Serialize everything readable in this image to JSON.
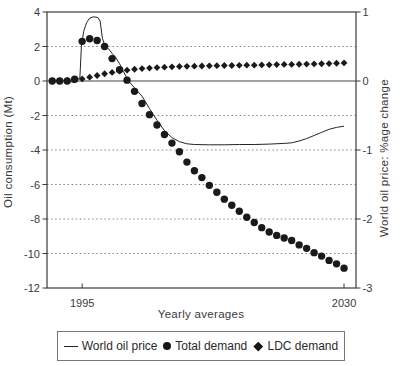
{
  "figure": {
    "background": "#ffffff",
    "ink_color": "#1a1a1a",
    "grid_color": "#777777"
  },
  "chart_data": {
    "type": "line",
    "title": "",
    "xlabel": "Yearly averages",
    "ylabel_left": "Oil consumption (Mt)",
    "ylabel_right": "World oil price: %age change",
    "x_range": [
      1990.3,
      2031.6
    ],
    "ylim_left": [
      -12,
      4
    ],
    "ylim_right": [
      -3,
      1
    ],
    "x_ticks": [
      {
        "year": 1995,
        "label": "1995"
      },
      {
        "year": 2030,
        "label": "2030"
      }
    ],
    "left_ticks": [
      4,
      2,
      0,
      -2,
      -4,
      -6,
      -8,
      -10,
      -12
    ],
    "left_tick_labels": [
      "4",
      "2",
      "0",
      "-2",
      "-4",
      "-6",
      "-8",
      "-10",
      "-12"
    ],
    "right_ticks": [
      1,
      0,
      -1,
      -2,
      -3
    ],
    "right_tick_labels": [
      "1",
      "0",
      "-1",
      "-2",
      "-3"
    ],
    "grid_values_left": [
      2,
      -2,
      -4,
      -6,
      -8,
      -10
    ],
    "zero_line_value": 0,
    "grid_style": "dotted horizontal gridlines every 2 Mt, solid line at 0",
    "legend_position": "bottom",
    "series": [
      {
        "name": "World oil price",
        "axis": "right",
        "kind": "line",
        "points": [
          [
            1991,
            0
          ],
          [
            1992,
            0
          ],
          [
            1993,
            0
          ],
          [
            1994,
            -0.02
          ],
          [
            1994.7,
            0.05
          ],
          [
            1994.9,
            0.5
          ],
          [
            1995.2,
            0.72
          ],
          [
            1995.6,
            0.85
          ],
          [
            1996,
            0.91
          ],
          [
            1996.5,
            0.93
          ],
          [
            1997.1,
            0.92
          ],
          [
            1997.4,
            0.87
          ],
          [
            1997.7,
            0.62
          ],
          [
            1998,
            0.52
          ],
          [
            1998.5,
            0.47
          ],
          [
            1999,
            0.4
          ],
          [
            1999.5,
            0.34
          ],
          [
            2000,
            0.25
          ],
          [
            2000.5,
            0.14
          ],
          [
            2001.2,
            0
          ],
          [
            2002,
            -0.1
          ],
          [
            2003,
            -0.22
          ],
          [
            2004,
            -0.4
          ],
          [
            2005,
            -0.57
          ],
          [
            2006,
            -0.72
          ],
          [
            2007,
            -0.82
          ],
          [
            2008,
            -0.88
          ],
          [
            2009,
            -0.91
          ],
          [
            2010,
            -0.92
          ],
          [
            2012,
            -0.925
          ],
          [
            2014,
            -0.925
          ],
          [
            2016,
            -0.92
          ],
          [
            2018,
            -0.92
          ],
          [
            2020,
            -0.915
          ],
          [
            2022,
            -0.905
          ],
          [
            2023,
            -0.895
          ],
          [
            2024,
            -0.87
          ],
          [
            2025,
            -0.835
          ],
          [
            2026,
            -0.79
          ],
          [
            2027,
            -0.745
          ],
          [
            2028,
            -0.7
          ],
          [
            2029,
            -0.672
          ],
          [
            2030,
            -0.655
          ]
        ]
      },
      {
        "name": "Total demand",
        "axis": "left",
        "kind": "scatter",
        "marker": "circle",
        "years": [
          1991,
          1992,
          1993,
          1994,
          1995,
          1996,
          1997,
          1998,
          1999,
          2000,
          2001,
          2002,
          2003,
          2004,
          2005,
          2006,
          2007,
          2008,
          2009,
          2010,
          2011,
          2012,
          2013,
          2014,
          2015,
          2016,
          2017,
          2018,
          2019,
          2020,
          2021,
          2022,
          2023,
          2024,
          2025,
          2026,
          2027,
          2028,
          2029,
          2030
        ],
        "values": [
          0,
          0,
          0,
          0.1,
          2.3,
          2.45,
          2.35,
          2.0,
          1.3,
          0.65,
          0.05,
          -0.6,
          -1.3,
          -1.95,
          -2.55,
          -3.1,
          -3.6,
          -4.1,
          -4.7,
          -5.2,
          -5.6,
          -6.05,
          -6.45,
          -6.85,
          -7.2,
          -7.55,
          -7.9,
          -8.2,
          -8.5,
          -8.75,
          -8.95,
          -9.1,
          -9.25,
          -9.5,
          -9.7,
          -9.95,
          -10.15,
          -10.4,
          -10.6,
          -10.85
        ]
      },
      {
        "name": "LDC demand",
        "axis": "left",
        "kind": "scatter",
        "marker": "diamond",
        "years": [
          1991,
          1992,
          1993,
          1994,
          1995,
          1996,
          1997,
          1998,
          1999,
          2000,
          2001,
          2002,
          2003,
          2004,
          2005,
          2006,
          2007,
          2008,
          2009,
          2010,
          2011,
          2012,
          2013,
          2014,
          2015,
          2016,
          2017,
          2018,
          2019,
          2020,
          2021,
          2022,
          2023,
          2024,
          2025,
          2026,
          2027,
          2028,
          2029,
          2030
        ],
        "values": [
          0,
          0,
          0.03,
          0.07,
          0.12,
          0.22,
          0.32,
          0.42,
          0.5,
          0.57,
          0.63,
          0.68,
          0.72,
          0.75,
          0.78,
          0.8,
          0.82,
          0.84,
          0.85,
          0.86,
          0.87,
          0.88,
          0.89,
          0.9,
          0.9,
          0.91,
          0.92,
          0.92,
          0.93,
          0.94,
          0.95,
          0.96,
          0.96,
          0.97,
          0.98,
          0.99,
          1.0,
          1.01,
          1.03,
          1.05
        ]
      }
    ]
  },
  "legend": {
    "items": [
      {
        "marker": "line",
        "label": "World oil price"
      },
      {
        "marker": "circle",
        "label": "Total demand"
      },
      {
        "marker": "diamond",
        "label": "LDC demand"
      }
    ]
  }
}
